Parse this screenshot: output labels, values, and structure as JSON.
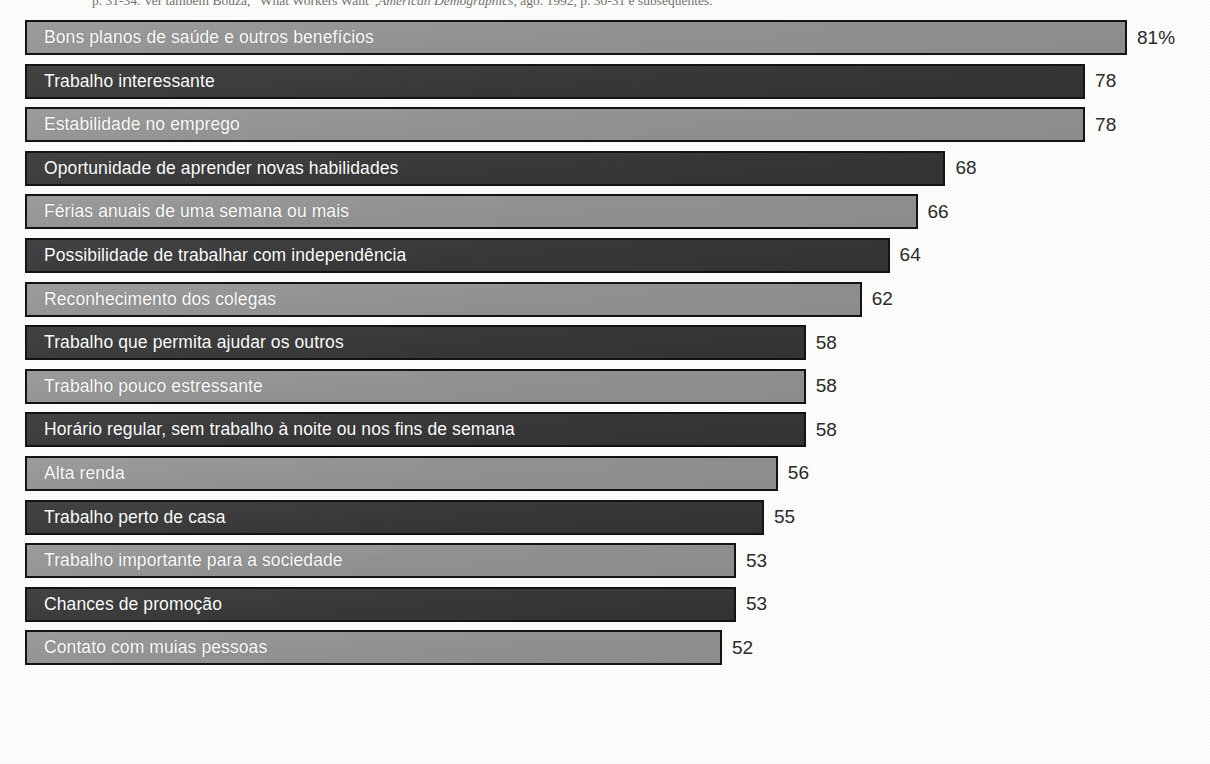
{
  "citation": {
    "prefix": "p. 31-34. Ver também Bouza, “What Workers Want”,",
    "italic_source": "American Demographics",
    "suffix": ", ago. 1992, p. 30-31 e subsequentes."
  },
  "colors": {
    "bar_light": "#959595",
    "bar_dark": "#3b3b3b",
    "bar_border": "#141414",
    "bar_label_text": "#ffffff",
    "value_text": "#2b2b2b",
    "background": "#fdfdfc"
  },
  "chart_data": {
    "type": "bar",
    "orientation": "horizontal",
    "title": "",
    "subtitle": "",
    "xlabel": "",
    "ylabel": "",
    "xlim": [
      0,
      81
    ],
    "grid": false,
    "legend": false,
    "value_unit": "%",
    "first_value_label": "81%",
    "categories": [
      "Bons planos de saúde e outros benefícios",
      "Trabalho interessante",
      "Estabilidade no emprego",
      "Oportunidade de aprender novas habilidades",
      "Férias anuais de uma semana ou mais",
      "Possibilidade de trabalhar com independência",
      "Reconhecimento dos colegas",
      "Trabalho que permita ajudar os outros",
      "Trabalho pouco estressante",
      "Horário regular, sem trabalho à noite ou nos fins de semana",
      "Alta renda",
      "Trabalho perto de casa",
      "Trabalho importante para a sociedade",
      "Chances de promoção",
      "Contato com muias pessoas"
    ],
    "values": [
      81,
      78,
      78,
      68,
      66,
      64,
      62,
      58,
      58,
      58,
      56,
      55,
      53,
      53,
      52
    ],
    "value_labels": [
      "81%",
      "78",
      "78",
      "68",
      "66",
      "64",
      "62",
      "58",
      "58",
      "58",
      "56",
      "55",
      "53",
      "53",
      "52"
    ],
    "bar_shades": [
      "light",
      "dark",
      "light",
      "dark",
      "light",
      "dark",
      "light",
      "dark",
      "light",
      "dark",
      "light",
      "dark",
      "light",
      "dark",
      "light"
    ]
  },
  "rows": [
    {
      "label": "Bons planos de saúde e outros benefícios",
      "value": 81,
      "value_label": "81%",
      "shade": "light"
    },
    {
      "label": "Trabalho interessante",
      "value": 78,
      "value_label": "78",
      "shade": "dark"
    },
    {
      "label": "Estabilidade no emprego",
      "value": 78,
      "value_label": "78",
      "shade": "light"
    },
    {
      "label": "Oportunidade de aprender novas habilidades",
      "value": 68,
      "value_label": "68",
      "shade": "dark"
    },
    {
      "label": "Férias anuais de uma semana ou mais",
      "value": 66,
      "value_label": "66",
      "shade": "light"
    },
    {
      "label": "Possibilidade de trabalhar com independência",
      "value": 64,
      "value_label": "64",
      "shade": "dark"
    },
    {
      "label": "Reconhecimento dos colegas",
      "value": 62,
      "value_label": "62",
      "shade": "light"
    },
    {
      "label": "Trabalho que permita ajudar os outros",
      "value": 58,
      "value_label": "58",
      "shade": "dark"
    },
    {
      "label": "Trabalho pouco estressante",
      "value": 58,
      "value_label": "58",
      "shade": "light"
    },
    {
      "label": "Horário regular, sem trabalho à noite ou nos fins de semana",
      "value": 58,
      "value_label": "58",
      "shade": "dark"
    },
    {
      "label": "Alta renda",
      "value": 56,
      "value_label": "56",
      "shade": "light"
    },
    {
      "label": "Trabalho perto de casa",
      "value": 55,
      "value_label": "55",
      "shade": "dark"
    },
    {
      "label": "Trabalho importante para a sociedade",
      "value": 53,
      "value_label": "53",
      "shade": "light"
    },
    {
      "label": "Chances de promoção",
      "value": 53,
      "value_label": "53",
      "shade": "dark"
    },
    {
      "label": "Contato com muias pessoas",
      "value": 52,
      "value_label": "52",
      "shade": "light"
    }
  ]
}
